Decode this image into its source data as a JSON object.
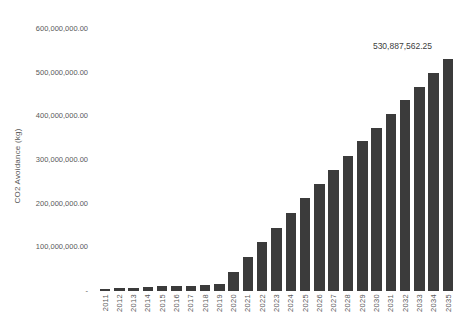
{
  "app": {
    "background_color": "#ffffff"
  },
  "chart_data": {
    "type": "bar",
    "title": "",
    "xlabel": "",
    "ylabel": "CO2 Avoidance (kg)",
    "categories": [
      "2011",
      "2012",
      "2013",
      "2014",
      "2015",
      "2016",
      "2017",
      "2018",
      "2019",
      "2020",
      "2021",
      "2022",
      "2023",
      "2024",
      "2025",
      "2026",
      "2027",
      "2028",
      "2029",
      "2030",
      "2031",
      "2032",
      "2033",
      "2034",
      "2035"
    ],
    "values": [
      3500000,
      7000000,
      8000000,
      9500000,
      10500000,
      11500000,
      12500000,
      14000000,
      15000000,
      43500000,
      78000000,
      112000000,
      144500000,
      178500000,
      213000000,
      245000000,
      277000000,
      309000000,
      343000000,
      373000000,
      405000000,
      437000000,
      467000000,
      499000000,
      530887562.25
    ],
    "ylim": [
      0,
      600000000
    ],
    "y_tick_interval": 100000000,
    "y_tick_labels": [
      "600,000,000.00",
      "500,000,000.00",
      "400,000,000.00",
      "300,000,000.00",
      "200,000,000.00",
      "100,000,000.00",
      "-"
    ],
    "grid": false,
    "legend": "none",
    "bar_color": "#3b3b3b",
    "tick_label_color": "#595959",
    "annotation": {
      "text": "530,887,562.25",
      "category": "2035"
    }
  }
}
